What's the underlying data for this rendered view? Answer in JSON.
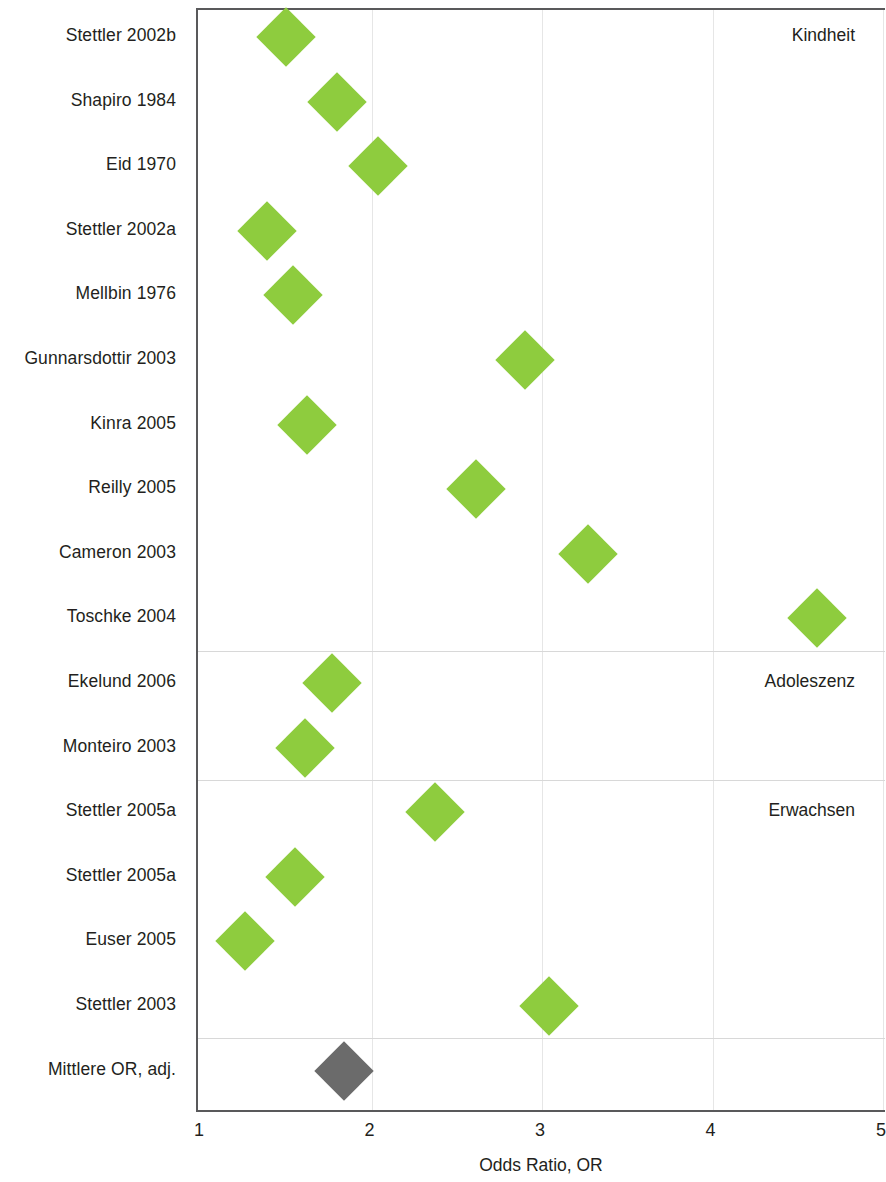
{
  "chart_data": {
    "type": "scatter",
    "title": "",
    "xlabel": "Odds Ratio, OR",
    "ylabel": "",
    "xlim": [
      1,
      5
    ],
    "xticks": [
      "1",
      "2",
      "3",
      "4",
      "5"
    ],
    "xtickvalues": [
      1,
      2,
      3,
      4,
      5
    ],
    "grid": "vertical",
    "legend": "none",
    "categories": [
      "Stettler 2002b",
      "Shapiro 1984",
      "Eid 1970",
      "Stettler 2002a",
      "Mellbin 1976",
      "Gunnarsdottir 2003",
      "Kinra 2005",
      "Reilly 2005",
      "Cameron 2003",
      "Toschke 2004",
      "Ekelund 2006",
      "Monteiro 2003",
      "Stettler 2005a",
      "Stettler 2005a",
      "Euser 2005",
      "Stettler 2003",
      "Mittlere OR, adj."
    ],
    "values": [
      1.5,
      1.8,
      2.04,
      1.39,
      1.54,
      2.9,
      1.62,
      2.61,
      3.27,
      4.61,
      1.77,
      1.61,
      2.37,
      1.55,
      1.26,
      3.04,
      1.84
    ],
    "point_colors": [
      "#8ecc3e",
      "#8ecc3e",
      "#8ecc3e",
      "#8ecc3e",
      "#8ecc3e",
      "#8ecc3e",
      "#8ecc3e",
      "#8ecc3e",
      "#8ecc3e",
      "#8ecc3e",
      "#8ecc3e",
      "#8ecc3e",
      "#8ecc3e",
      "#8ecc3e",
      "#8ecc3e",
      "#8ecc3e",
      "#6b6b6b"
    ],
    "annotations": [
      {
        "text": "Kindheit",
        "row_index": 0,
        "align": "right"
      },
      {
        "text": "Adoleszenz",
        "row_index": 10,
        "align": "right"
      },
      {
        "text": "Erwachsen",
        "row_index": 12,
        "align": "right"
      }
    ],
    "group_separators_after": [
      9,
      11,
      15
    ],
    "colors": {
      "marker_green": "#8ecc3e",
      "marker_grey": "#6b6b6b",
      "axis": "#59595b",
      "gridline": "#e6e6e6",
      "text": "#231f20"
    }
  }
}
